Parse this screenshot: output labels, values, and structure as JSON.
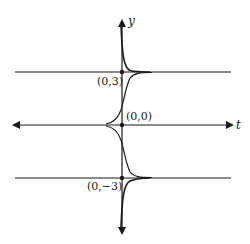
{
  "diagram": {
    "type": "solution-curves",
    "axes": {
      "horizontal_label": "t",
      "vertical_label": "y"
    },
    "equilibria": [
      {
        "value": 3,
        "label": "(0,3)"
      },
      {
        "value": 0,
        "label": "(0,0)"
      },
      {
        "value": -3,
        "label": "(0,−3)"
      }
    ],
    "labels": {
      "y_axis": "y",
      "t_axis": "t",
      "point_upper": "(0,3)",
      "point_origin": "(0,0)",
      "point_lower": "(0,−3)"
    },
    "colors": {
      "ink": "#1a1a1a",
      "background": "#ffffff"
    }
  }
}
